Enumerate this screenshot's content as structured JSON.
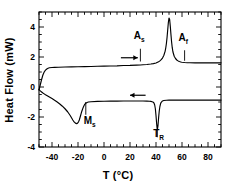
{
  "chart_data": {
    "type": "line",
    "title": "",
    "xlabel": "T (°C)",
    "ylabel": "Heat Flow (mW)",
    "xlim": [
      -50,
      90
    ],
    "ylim": [
      -4,
      5
    ],
    "xticks": [
      -40,
      -20,
      0,
      20,
      40,
      60,
      80
    ],
    "xtick_labels": [
      "-40",
      "-20",
      "0",
      "20",
      "40",
      "60",
      "80"
    ],
    "yticks": [
      -4,
      -2,
      0,
      2,
      4
    ],
    "ytick_labels": [
      "-4",
      "-2",
      "0",
      "2",
      "4"
    ],
    "grid": false,
    "legend": "none",
    "frame": "box",
    "minor_ticks": true,
    "series": [
      {
        "name": "heating",
        "direction": "right",
        "x": [
          -50,
          -49,
          -48,
          -47,
          -46,
          -45,
          -44,
          -43,
          -42,
          -40,
          -38,
          -35,
          -30,
          -25,
          -20,
          -15,
          -10,
          -5,
          0,
          5,
          10,
          15,
          20,
          25,
          28,
          30,
          33,
          36,
          38,
          40,
          42,
          43,
          44,
          45,
          46,
          47,
          47.5,
          48,
          48.5,
          49,
          49.5,
          50,
          50.5,
          51,
          51.5,
          52,
          52.5,
          53,
          54,
          55,
          56,
          57,
          58,
          59,
          60,
          62,
          64,
          66,
          70,
          75,
          80,
          85,
          90
        ],
        "y": [
          -0.2,
          0.15,
          0.5,
          0.8,
          1.0,
          1.12,
          1.2,
          1.25,
          1.28,
          1.3,
          1.31,
          1.32,
          1.33,
          1.34,
          1.35,
          1.36,
          1.37,
          1.38,
          1.39,
          1.4,
          1.41,
          1.43,
          1.44,
          1.46,
          1.47,
          1.48,
          1.5,
          1.53,
          1.56,
          1.6,
          1.68,
          1.74,
          1.82,
          1.93,
          2.1,
          2.38,
          2.6,
          2.9,
          3.3,
          3.8,
          4.3,
          4.6,
          4.5,
          4.05,
          3.5,
          3.0,
          2.62,
          2.35,
          2.05,
          1.9,
          1.8,
          1.74,
          1.7,
          1.67,
          1.65,
          1.63,
          1.62,
          1.62,
          1.61,
          1.61,
          1.61,
          1.61,
          1.61
        ]
      },
      {
        "name": "cooling",
        "direction": "left",
        "x": [
          -50,
          -49,
          -48,
          -47,
          -46,
          -45,
          -44,
          -43,
          -42,
          -41,
          -40,
          -38,
          -36,
          -34,
          -32,
          -30,
          -28,
          -26,
          -25,
          -24,
          -23,
          -22,
          -21,
          -20.5,
          -20,
          -19.5,
          -19,
          -18.5,
          -18,
          -17.5,
          -17,
          -16.5,
          -16,
          -15.5,
          -15,
          -14,
          -13,
          -12,
          -10,
          -5,
          0,
          5,
          10,
          15,
          20,
          25,
          30,
          33,
          35,
          36,
          37,
          38,
          38.5,
          39,
          39.5,
          40,
          40.5,
          41,
          41.5,
          42,
          42.5,
          43,
          43.5,
          44,
          45,
          46,
          48,
          50,
          55,
          60,
          65,
          70,
          75,
          80,
          85,
          90
        ],
        "y": [
          -0.18,
          -0.26,
          -0.33,
          -0.4,
          -0.46,
          -0.52,
          -0.57,
          -0.62,
          -0.67,
          -0.72,
          -0.77,
          -0.88,
          -1.0,
          -1.13,
          -1.28,
          -1.45,
          -1.65,
          -1.9,
          -2.05,
          -2.2,
          -2.33,
          -2.41,
          -2.44,
          -2.43,
          -2.38,
          -2.3,
          -2.2,
          -2.05,
          -1.9,
          -1.74,
          -1.6,
          -1.48,
          -1.36,
          -1.26,
          -1.18,
          -1.08,
          -1.03,
          -1.0,
          -0.98,
          -0.96,
          -0.95,
          -0.94,
          -0.94,
          -0.93,
          -0.93,
          -0.93,
          -0.93,
          -0.94,
          -0.95,
          -0.96,
          -0.98,
          -1.02,
          -1.08,
          -1.2,
          -1.45,
          -1.9,
          -2.45,
          -2.88,
          -2.6,
          -2.05,
          -1.6,
          -1.3,
          -1.12,
          -1.02,
          -0.93,
          -0.9,
          -0.88,
          -0.87,
          -0.87,
          -0.87,
          -0.87,
          -0.87,
          -0.87,
          -0.87,
          -0.87,
          -0.87
        ]
      }
    ],
    "annotations": [
      {
        "id": "As",
        "label": "A",
        "sub": "s",
        "x": 28,
        "marker_y_top": 2.55,
        "marker_y_bottom": 1.7,
        "label_x": 27,
        "label_y": 3.2
      },
      {
        "id": "Af",
        "label": "A",
        "sub": "f",
        "x": 62,
        "marker_y_top": 2.45,
        "marker_y_bottom": 1.75,
        "label_x": 61,
        "label_y": 3.1
      },
      {
        "id": "Ms",
        "label": "M",
        "sub": "s",
        "x": -14,
        "marker_y_top": -1.0,
        "marker_y_bottom": -1.85,
        "label_x": -11,
        "label_y": -2.45
      },
      {
        "id": "TR",
        "label": "T",
        "sub": "R",
        "x": 41,
        "marker_y_top": -2.9,
        "marker_y_bottom": -3.35,
        "label_x": 42,
        "label_y": -3.35
      }
    ],
    "arrows": [
      {
        "id": "heating-arrow",
        "direction": "right",
        "x_start": 13,
        "x_end": 26,
        "y": 1.95
      },
      {
        "id": "cooling-arrow",
        "direction": "left",
        "x_start": 32,
        "x_end": 20,
        "y": -0.55
      }
    ],
    "colors": {
      "curve": "#000000",
      "axis": "#000000",
      "background": "#ffffff"
    }
  }
}
